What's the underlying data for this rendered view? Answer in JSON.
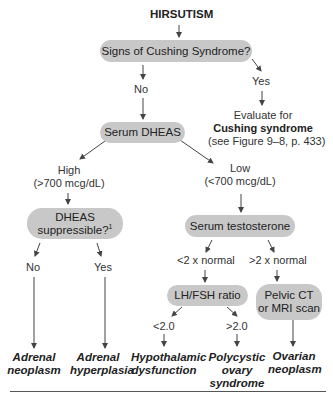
{
  "title": "HIRSUTISM",
  "nodes": {
    "cushing_q": "Signs of Cushing Syndrome?",
    "serum_dheas": "Serum DHEAS",
    "dheas_supp_line1": "DHEAS",
    "dheas_supp_line2": "suppressible?",
    "dheas_supp_footnote": "1",
    "serum_testosterone": "Serum testosterone",
    "lh_fsh": "LH/FSH ratio",
    "pelvic_ct_line1": "Pelvic CT",
    "pelvic_ct_line2": "or MRI scan"
  },
  "branch_labels": {
    "no_cushing": "No",
    "yes_cushing": "Yes",
    "high_line1": "High",
    "high_line2": "(>700 mcg/dL)",
    "low_line1": "Low",
    "low_line2": "(<700 mcg/dL)",
    "supp_no": "No",
    "supp_yes": "Yes",
    "lt2x": "<2 x normal",
    "gt2x": ">2 x normal",
    "lt2": "<2.0",
    "gt2": ">2.0"
  },
  "evaluate": {
    "line1": "Evaluate for",
    "line2": "Cushing syndrome",
    "line3": "(see Figure 9–8, p. 433)"
  },
  "outcomes": {
    "adrenal_neoplasm": [
      "Adrenal",
      "neoplasm"
    ],
    "adrenal_hyperplasia": [
      "Adrenal",
      "hyperplasia"
    ],
    "hypothalamic": [
      "Hypothalamic",
      "dysfunction"
    ],
    "pcos": [
      "Polycystic",
      "ovary",
      "syndrome"
    ],
    "ovarian_neoplasm": [
      "Ovarian",
      "neoplasm"
    ]
  },
  "colors": {
    "node_fill": "#c8c8c8",
    "arrow": "#444444"
  }
}
